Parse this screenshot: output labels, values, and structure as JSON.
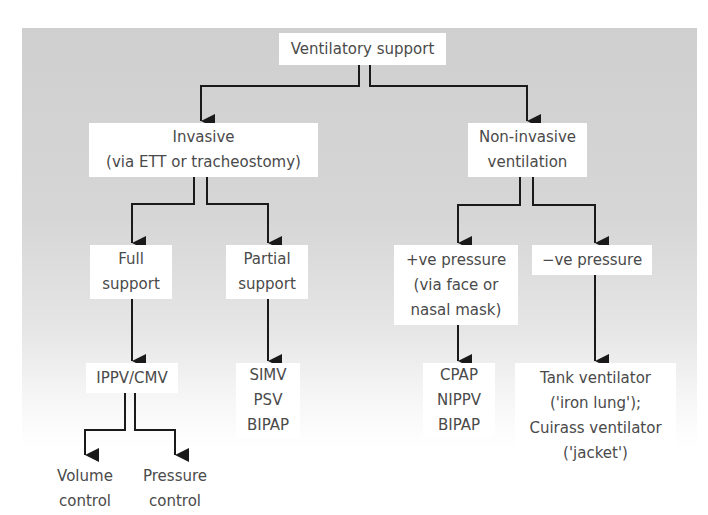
{
  "diagram": {
    "type": "flowchart",
    "title": "Ventilatory support",
    "colors": {
      "background_gray": "#d0d0d0",
      "box_fill": "#ffffff",
      "line": "#1a1a1a",
      "text": "#4a4a4a"
    },
    "nodes": {
      "root": {
        "lines": [
          "Ventilatory support"
        ]
      },
      "invasive": {
        "lines": [
          "Invasive",
          "(via ETT or tracheostomy)"
        ]
      },
      "noninvasive": {
        "lines": [
          "Non-invasive",
          "ventilation"
        ]
      },
      "full_support": {
        "lines": [
          "Full",
          "support"
        ]
      },
      "partial_support": {
        "lines": [
          "Partial",
          "support"
        ]
      },
      "positive_pressure": {
        "lines": [
          "+ve pressure",
          "(via face or",
          "nasal mask)"
        ]
      },
      "negative_pressure": {
        "lines": [
          "−ve pressure"
        ]
      },
      "ippv_cmv": {
        "lines": [
          "IPPV/CMV"
        ]
      },
      "partial_modes": {
        "lines": [
          "SIMV",
          "PSV",
          "BIPAP"
        ]
      },
      "niv_modes": {
        "lines": [
          "CPAP",
          "NIPPV",
          "BIPAP"
        ]
      },
      "negative_devices": {
        "lines": [
          "Tank ventilator",
          "('iron lung');",
          "Cuirass ventilator",
          "('jacket')"
        ]
      },
      "volume_control": {
        "lines": [
          "Volume",
          "control"
        ]
      },
      "pressure_control": {
        "lines": [
          "Pressure",
          "control"
        ]
      }
    },
    "edges": [
      [
        "root",
        "invasive"
      ],
      [
        "root",
        "noninvasive"
      ],
      [
        "invasive",
        "full_support"
      ],
      [
        "invasive",
        "partial_support"
      ],
      [
        "noninvasive",
        "positive_pressure"
      ],
      [
        "noninvasive",
        "negative_pressure"
      ],
      [
        "full_support",
        "ippv_cmv"
      ],
      [
        "partial_support",
        "partial_modes"
      ],
      [
        "positive_pressure",
        "niv_modes"
      ],
      [
        "negative_pressure",
        "negative_devices"
      ],
      [
        "ippv_cmv",
        "volume_control"
      ],
      [
        "ippv_cmv",
        "pressure_control"
      ]
    ]
  }
}
